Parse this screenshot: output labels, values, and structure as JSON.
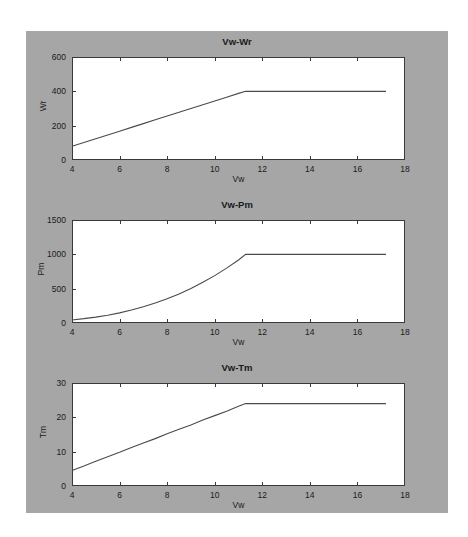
{
  "figure": {
    "background_color": "#a6a6a6",
    "axes_color": "#3a3a3a",
    "line_color": "#4a4a4a"
  },
  "chart_data": [
    {
      "type": "line",
      "title": "Vw-Wr",
      "xlabel": "Vw",
      "ylabel": "Wr",
      "xlim": [
        4,
        18
      ],
      "ylim": [
        0,
        600
      ],
      "xticks": [
        4,
        6,
        8,
        10,
        12,
        14,
        16,
        18
      ],
      "yticks": [
        0,
        200,
        400,
        600
      ],
      "grid": false,
      "legend": null,
      "x": [
        4.0,
        4.5,
        5.0,
        5.5,
        6.0,
        6.5,
        7.0,
        7.5,
        8.0,
        8.5,
        9.0,
        9.5,
        10.0,
        10.5,
        11.0,
        11.3,
        12.0,
        13.0,
        14.0,
        15.0,
        16.0,
        17.2
      ],
      "values": [
        80,
        102,
        124,
        146,
        168,
        190,
        212,
        234,
        256,
        278,
        300,
        322,
        344,
        366,
        388,
        400,
        400,
        400,
        400,
        400,
        400,
        400
      ]
    },
    {
      "type": "line",
      "title": "Vw-Pm",
      "xlabel": "Vw",
      "ylabel": "Pm",
      "xlim": [
        4,
        18
      ],
      "ylim": [
        0,
        1500
      ],
      "xticks": [
        4,
        6,
        8,
        10,
        12,
        14,
        16,
        18
      ],
      "yticks": [
        0,
        500,
        1000,
        1500
      ],
      "grid": false,
      "legend": null,
      "x": [
        4.0,
        4.5,
        5.0,
        5.5,
        6.0,
        6.5,
        7.0,
        7.5,
        8.0,
        8.5,
        9.0,
        9.5,
        10.0,
        10.5,
        11.0,
        11.3,
        12.0,
        13.0,
        14.0,
        15.0,
        16.0,
        17.2
      ],
      "values": [
        44,
        63,
        86,
        114,
        148,
        189,
        236,
        291,
        353,
        424,
        503,
        592,
        690,
        799,
        918,
        1000,
        1000,
        1000,
        1000,
        1000,
        1000,
        1000
      ]
    },
    {
      "type": "line",
      "title": "Vw-Tm",
      "xlabel": "Vw",
      "ylabel": "Tm",
      "xlim": [
        4,
        18
      ],
      "ylim": [
        0,
        30
      ],
      "xticks": [
        4,
        6,
        8,
        10,
        12,
        14,
        16,
        18
      ],
      "yticks": [
        0,
        10,
        20,
        30
      ],
      "grid": false,
      "legend": null,
      "x": [
        4.0,
        4.5,
        5.0,
        5.5,
        6.0,
        6.5,
        7.0,
        7.5,
        8.0,
        8.5,
        9.0,
        9.5,
        10.0,
        10.5,
        11.0,
        11.3,
        12.0,
        13.0,
        14.0,
        15.0,
        16.0,
        17.2
      ],
      "values": [
        4.5,
        5.8,
        7.2,
        8.5,
        9.8,
        11.2,
        12.5,
        13.8,
        15.2,
        16.5,
        17.8,
        19.2,
        20.5,
        21.8,
        23.2,
        24.0,
        24.0,
        24.0,
        24.0,
        24.0,
        24.0,
        24.0
      ]
    }
  ]
}
